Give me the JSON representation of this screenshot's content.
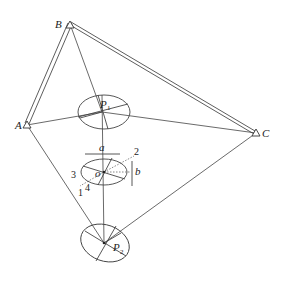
{
  "diagram": {
    "type": "geometry",
    "stations": [
      {
        "id": "A",
        "label": "A",
        "x": 27,
        "y": 125
      },
      {
        "id": "B",
        "label": "B",
        "x": 70,
        "y": 24
      },
      {
        "id": "C",
        "label": "C",
        "x": 256,
        "y": 133
      }
    ],
    "points": [
      {
        "id": "P1",
        "label": "P",
        "subscript": "1",
        "x": 102,
        "y": 112
      },
      {
        "id": "o",
        "label": "o",
        "x": 101,
        "y": 172
      },
      {
        "id": "P2",
        "label": "P",
        "subscript": "2",
        "x": 104,
        "y": 243
      }
    ],
    "axis_labels": {
      "a": "a",
      "b": "b"
    },
    "direction_labels": [
      "1",
      "2",
      "3",
      "4"
    ]
  }
}
